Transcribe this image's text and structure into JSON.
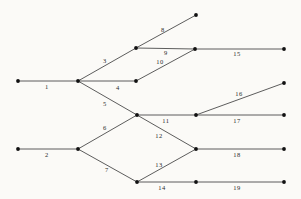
{
  "figure": {
    "type": "node-link-diagram",
    "background_color": "#fbfaf7",
    "edge_color": "#4b4b4b",
    "node_color": "#111111",
    "width": 301,
    "height": 199
  },
  "graph": {
    "nodes": [
      {
        "id": "n1",
        "name": "source-upper",
        "x": 18,
        "y": 81
      },
      {
        "id": "n2",
        "name": "source-lower",
        "x": 18,
        "y": 149
      },
      {
        "id": "n3",
        "name": "upper-fork",
        "x": 78,
        "y": 81
      },
      {
        "id": "n4",
        "name": "lower-fork",
        "x": 78,
        "y": 149
      },
      {
        "id": "n5",
        "name": "upper-branch-top",
        "x": 136,
        "y": 48
      },
      {
        "id": "n6",
        "name": "upper-branch-mid",
        "x": 136,
        "y": 81
      },
      {
        "id": "n7",
        "name": "diamond-left",
        "x": 137,
        "y": 115
      },
      {
        "id": "n8",
        "name": "diamond-bottom",
        "x": 137,
        "y": 182
      },
      {
        "id": "n9",
        "name": "sink-topmost",
        "x": 196,
        "y": 15
      },
      {
        "id": "n10",
        "name": "merge-upper",
        "x": 195,
        "y": 49
      },
      {
        "id": "n11",
        "name": "merge-middle",
        "x": 196,
        "y": 115
      },
      {
        "id": "n12",
        "name": "diamond-right",
        "x": 196,
        "y": 149
      },
      {
        "id": "n13",
        "name": "bottom-mid",
        "x": 196,
        "y": 182
      },
      {
        "id": "n14",
        "name": "terminal-15",
        "x": 284,
        "y": 49
      },
      {
        "id": "n15",
        "name": "terminal-16",
        "x": 284,
        "y": 83
      },
      {
        "id": "n16",
        "name": "terminal-17",
        "x": 284,
        "y": 115
      },
      {
        "id": "n17",
        "name": "terminal-18",
        "x": 284,
        "y": 149
      },
      {
        "id": "n18",
        "name": "terminal-19",
        "x": 284,
        "y": 182
      }
    ],
    "edges": [
      {
        "label": "1",
        "from": "n1",
        "to": "n3",
        "label_x": 47,
        "label_y": 87
      },
      {
        "label": "2",
        "from": "n2",
        "to": "n4",
        "label_x": 47,
        "label_y": 155
      },
      {
        "label": "3",
        "from": "n3",
        "to": "n5",
        "label_x": 105,
        "label_y": 61
      },
      {
        "label": "4",
        "from": "n3",
        "to": "n6",
        "label_x": 118,
        "label_y": 88
      },
      {
        "label": "5",
        "from": "n3",
        "to": "n7",
        "label_x": 105,
        "label_y": 104
      },
      {
        "label": "6",
        "from": "n4",
        "to": "n7",
        "label_x": 105,
        "label_y": 128
      },
      {
        "label": "7",
        "from": "n4",
        "to": "n8",
        "label_x": 107,
        "label_y": 170
      },
      {
        "label": "8",
        "from": "n5",
        "to": "n9",
        "label_x": 163,
        "label_y": 30
      },
      {
        "label": "9",
        "from": "n5",
        "to": "n10",
        "label_x": 166,
        "label_y": 53
      },
      {
        "label": "10",
        "from": "n6",
        "to": "n10",
        "label_x": 160,
        "label_y": 62
      },
      {
        "label": "11",
        "from": "n7",
        "to": "n11",
        "label_x": 166,
        "label_y": 121
      },
      {
        "label": "12",
        "from": "n7",
        "to": "n12",
        "label_x": 159,
        "label_y": 136
      },
      {
        "label": "13",
        "from": "n8",
        "to": "n12",
        "label_x": 159,
        "label_y": 165
      },
      {
        "label": "14",
        "from": "n8",
        "to": "n13",
        "label_x": 162,
        "label_y": 188
      },
      {
        "label": "15",
        "from": "n10",
        "to": "n14",
        "label_x": 237,
        "label_y": 54
      },
      {
        "label": "16",
        "from": "n11",
        "to": "n15",
        "label_x": 239,
        "label_y": 94
      },
      {
        "label": "17",
        "from": "n11",
        "to": "n16",
        "label_x": 237,
        "label_y": 121
      },
      {
        "label": "18",
        "from": "n12",
        "to": "n17",
        "label_x": 237,
        "label_y": 155
      },
      {
        "label": "19",
        "from": "n13",
        "to": "n18",
        "label_x": 237,
        "label_y": 188
      }
    ]
  }
}
